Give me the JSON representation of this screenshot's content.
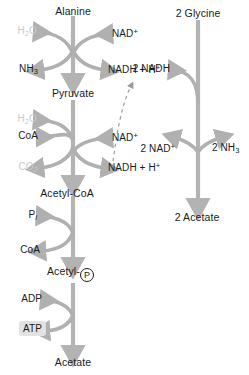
{
  "diagram": {
    "colors": {
      "arrow_main": "#b3b3b3",
      "arrow_curve": "#b0b0b0",
      "text_dark": "#1a1a1a",
      "text_faded": "#c9c9c9",
      "highlight_chip": "#e2e2e2",
      "dashed_arrow": "#9a9a9a"
    },
    "left_pathway": {
      "name": "alanine-branch",
      "metabolites": [
        {
          "id": "alanine",
          "label": "Alanine"
        },
        {
          "id": "pyruvate",
          "label": "Pyruvate"
        },
        {
          "id": "acetyl-coa",
          "label": "Acetyl-CoA"
        },
        {
          "id": "acetyl-phosphate",
          "label": "Acetyl-",
          "symbol": "P"
        },
        {
          "id": "acetate",
          "label": "Acetate"
        }
      ],
      "steps": [
        {
          "id": "alanine-to-pyruvate",
          "inputs": [
            {
              "id": "water-in",
              "text": "H",
              "sub": "2",
              "text2": "O",
              "style": "faded"
            },
            {
              "id": "nad-plus-in",
              "text": "NAD",
              "sup": "+",
              "style": "dark"
            }
          ],
          "outputs": [
            {
              "id": "ammonia-out",
              "text": "NH",
              "sub": "3",
              "style": "dark"
            },
            {
              "id": "nadh-out",
              "text": "NADH + H",
              "sup": "+",
              "style": "dark"
            }
          ]
        },
        {
          "id": "pyruvate-to-acetyl-coa",
          "inputs": [
            {
              "id": "water-in-2",
              "text": "H",
              "sub": "2",
              "text2": "O",
              "style": "faded"
            },
            {
              "id": "coa-in",
              "text": "CoA",
              "style": "dark"
            },
            {
              "id": "nad-plus-in-2",
              "text": "NAD",
              "sup": "+",
              "style": "dark"
            }
          ],
          "outputs": [
            {
              "id": "co2-out",
              "text": "CO",
              "sub": "2",
              "style": "faded"
            },
            {
              "id": "nadh-out-2",
              "text": "NADH + H",
              "sup": "+",
              "style": "dark"
            }
          ]
        },
        {
          "id": "acetyl-coa-to-acetyl-phosphate",
          "inputs": [
            {
              "id": "phosphate-in",
              "text": "P",
              "sub_i": "i",
              "style": "dark"
            }
          ],
          "outputs": [
            {
              "id": "coa-out",
              "text": "CoA",
              "style": "dark"
            }
          ]
        },
        {
          "id": "acetyl-phosphate-to-acetate",
          "inputs": [
            {
              "id": "adp-in",
              "text": "ADP",
              "style": "dark"
            }
          ],
          "outputs": [
            {
              "id": "atp-out",
              "text": "ATP",
              "style": "dark",
              "highlighted": true
            }
          ]
        }
      ]
    },
    "right_pathway": {
      "name": "glycine-branch",
      "metabolites": [
        {
          "id": "glycine",
          "label": "2 Glycine"
        },
        {
          "id": "acetate-2",
          "label": "2 Acetate"
        }
      ],
      "inputs": [
        {
          "id": "nadh-in-right",
          "text": "2 NADH",
          "style": "dark"
        }
      ],
      "outputs": [
        {
          "id": "nad-plus-out-right",
          "text": "2 NAD",
          "sup": "+",
          "style": "dark"
        },
        {
          "id": "ammonia-out-right",
          "text": "2 NH",
          "sub": "3",
          "style": "dark"
        }
      ]
    },
    "connector": {
      "id": "reducing-equivalent-transfer",
      "style": "dashed",
      "from": "nadh-out-2",
      "to": "nadh-in-right",
      "label": ""
    }
  }
}
